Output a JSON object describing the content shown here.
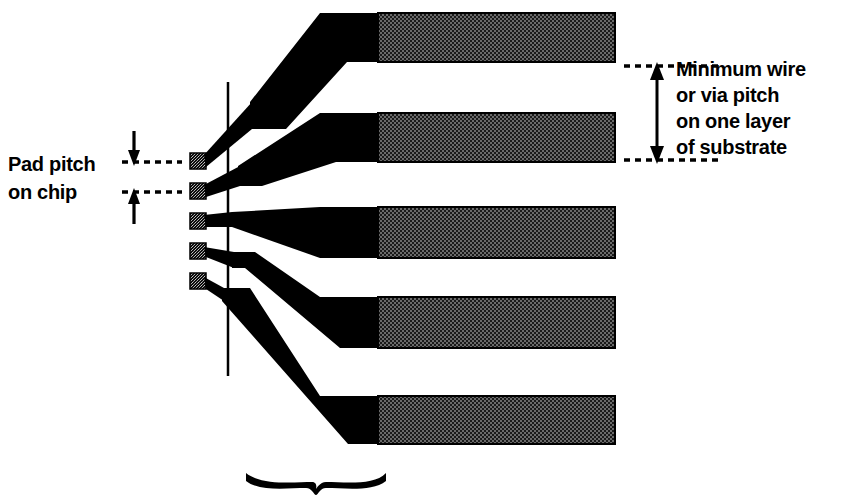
{
  "figure": {
    "background_color": "#ffffff",
    "ink_color": "#000000",
    "bar_fill_color": "#3a3a3a"
  },
  "labels": {
    "pad_pitch": {
      "name": "pad-pitch-label",
      "lines": [
        "Pad pitch",
        "on chip"
      ]
    },
    "min_pitch": {
      "name": "minimum-wire-pitch-label",
      "lines": [
        "Minimum wire",
        "or via pitch",
        "on one layer",
        "of substrate"
      ]
    }
  },
  "chip_pads": {
    "count": 5,
    "pad_size": 15,
    "pitch": 30,
    "x": 190,
    "y_positions": [
      153,
      183,
      213,
      243,
      273
    ]
  },
  "chip_edge_line": {
    "name": "chip-edge-line",
    "x": 228,
    "y_top": 82,
    "y_bottom": 376
  },
  "substrate_wires": {
    "count": 5,
    "gray_start_x": 378,
    "right_x": 615,
    "bars": [
      {
        "top": 13,
        "bottom": 62,
        "taper_tip_x": 320
      },
      {
        "top": 113,
        "bottom": 162,
        "taper_tip_x": 320
      },
      {
        "top": 207,
        "bottom": 258,
        "taper_tip_x": 320
      },
      {
        "top": 297,
        "bottom": 348,
        "taper_tip_x": 320
      },
      {
        "top": 396,
        "bottom": 444,
        "taper_tip_x": 320
      }
    ]
  },
  "pad_pitch_dimension": {
    "name": "pad-pitch-dimension",
    "dotted_line_left_x": 122,
    "dotted_line_right_x": 182,
    "top_y": 162,
    "bottom_y": 192,
    "arrow_x": 134
  },
  "wire_pitch_dimension": {
    "name": "wire-pitch-dimension",
    "dotted_line_left_x": 624,
    "dotted_line_right_x": 722,
    "top_y": 66,
    "bottom_y": 160,
    "arrow_x": 657
  },
  "bottom_brace": {
    "name": "substrate-brace",
    "left_x": 245,
    "right_x": 386,
    "y": 478
  }
}
